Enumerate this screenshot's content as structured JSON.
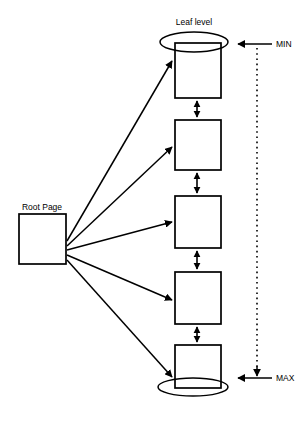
{
  "diagram": {
    "type": "b-tree-leaf-level-diagram",
    "background_color": "#ffffff",
    "line_color": "#000000",
    "labels": {
      "leaf_level": "Leaf level",
      "root_page": "Root Page",
      "min_marker": "MIN",
      "max_marker": "MAX"
    },
    "root": {
      "label": "Root Page",
      "x": 19,
      "y": 214,
      "width": 47,
      "height": 50
    },
    "leaf_nodes": [
      {
        "index": 1,
        "x": 175,
        "y": 43,
        "width": 46,
        "height": 55
      },
      {
        "index": 2,
        "x": 175,
        "y": 120,
        "width": 46,
        "height": 50
      },
      {
        "index": 3,
        "x": 175,
        "y": 196,
        "width": 46,
        "height": 52
      },
      {
        "index": 4,
        "x": 175,
        "y": 272,
        "width": 46,
        "height": 52
      },
      {
        "index": 5,
        "x": 175,
        "y": 345,
        "width": 46,
        "height": 43
      }
    ],
    "sibling_links": [
      {
        "from": 1,
        "to": 2,
        "double_headed": true
      },
      {
        "from": 2,
        "to": 3,
        "double_headed": true
      },
      {
        "from": 3,
        "to": 4,
        "double_headed": true
      },
      {
        "from": 4,
        "to": 5,
        "double_headed": true
      }
    ],
    "root_to_leaf_arrows": [
      {
        "target": 1
      },
      {
        "target": 2
      },
      {
        "target": 3
      },
      {
        "target": 4
      },
      {
        "target": 5
      }
    ],
    "ellipses": [
      {
        "name": "top-ellipse",
        "cx": 194,
        "cy": 42,
        "rx": 34,
        "ry": 10
      },
      {
        "name": "bottom-ellipse",
        "cx": 193,
        "cy": 387,
        "rx": 35,
        "ry": 9
      }
    ],
    "range_indicator": {
      "x": 257,
      "y_top": 48,
      "y_bottom": 376,
      "style": "dotted",
      "min_label": "MIN",
      "max_label": "MAX",
      "min_arrow_y": 44,
      "max_arrow_y": 378
    }
  }
}
